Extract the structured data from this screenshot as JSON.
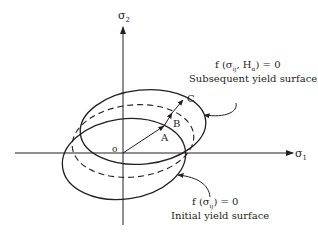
{
  "diagram": {
    "axes": {
      "x_label": "σ",
      "x_sub": "1",
      "y_label": "σ",
      "y_sub": "2",
      "origin_label": "o"
    },
    "points": {
      "a": "A",
      "b": "B",
      "c": "C"
    },
    "subsequent": {
      "eq_f": "f (σ",
      "eq_ij": "ij",
      "eq_h": ", H",
      "eq_a": "α",
      "eq_end": ") = 0",
      "caption": "Subsequent yield surface"
    },
    "initial": {
      "eq_f": "f (σ",
      "eq_ij": "ij",
      "eq_end": ") = 0",
      "caption": "Initial yield surface"
    },
    "colors": {
      "ink": "#231f20",
      "background": "#ffffff"
    }
  }
}
